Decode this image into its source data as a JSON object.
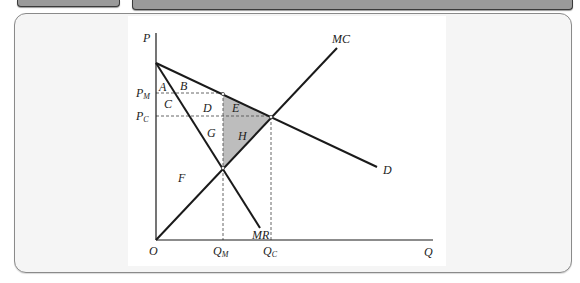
{
  "window": {
    "top_bars": [
      "left-tab-bar",
      "right-tab-bar"
    ]
  },
  "diagram": {
    "type": "monopoly-deadweight-loss",
    "axes": {
      "y_label": "P",
      "x_label": "Q",
      "origin_label": "O"
    },
    "price_labels": {
      "pm_main": "P",
      "pm_sub": "M",
      "pc_main": "P",
      "pc_sub": "C"
    },
    "quantity_labels": {
      "qm_main": "Q",
      "qm_sub": "M",
      "qc_main": "Q",
      "qc_sub": "C"
    },
    "curves": {
      "mc": "MC",
      "demand": "D",
      "mr": "MR"
    },
    "areas": {
      "a": "A",
      "b": "B",
      "c": "C",
      "d": "D",
      "e": "E",
      "f": "F",
      "g": "G",
      "h": "H"
    },
    "shaded_areas": [
      "E",
      "H"
    ],
    "colors": {
      "shade": "#bdbdbd",
      "line": "#1a1a1a",
      "dashed": "#555555"
    }
  }
}
